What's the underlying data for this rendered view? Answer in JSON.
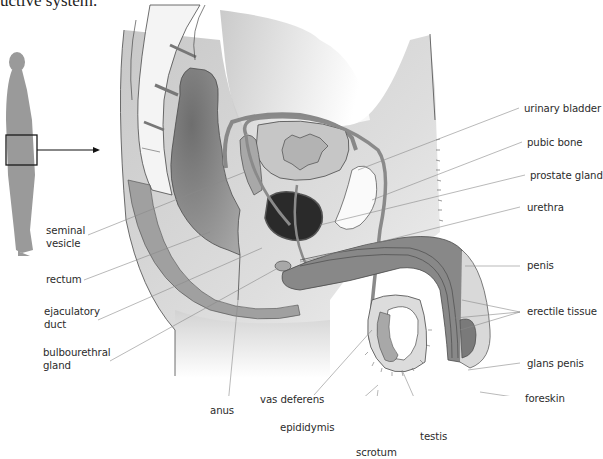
{
  "caption": "uctive system.",
  "figure": {
    "locator": {
      "description": "standing human silhouette with pelvic region boxed",
      "arrow": "arrow-right-icon"
    },
    "colors": {
      "tissue_light": "#e3e3e3",
      "tissue_mid": "#a9a9a9",
      "tissue_dark": "#7d7d7d",
      "prostate": "#2a2a2a",
      "bone": "#f4f4f4",
      "outline": "#4a4a4a",
      "leader": "#8a8a8a",
      "silhouette": "#9a9a9a"
    }
  },
  "labels": {
    "left": [
      {
        "id": "seminal-vesicle",
        "text": [
          "seminal",
          "vesicle"
        ]
      },
      {
        "id": "rectum",
        "text": [
          "rectum"
        ]
      },
      {
        "id": "ejaculatory-duct",
        "text": [
          "ejaculatory",
          "duct"
        ]
      },
      {
        "id": "bulbourethral-gland",
        "text": [
          "bulbourethral",
          "gland"
        ]
      }
    ],
    "right": [
      {
        "id": "urinary-bladder",
        "text": [
          "urinary bladder"
        ]
      },
      {
        "id": "pubic-bone",
        "text": [
          "pubic bone"
        ]
      },
      {
        "id": "prostate-gland",
        "text": [
          "prostate gland"
        ]
      },
      {
        "id": "urethra",
        "text": [
          "urethra"
        ]
      },
      {
        "id": "penis",
        "text": [
          "penis"
        ]
      },
      {
        "id": "erectile-tissue",
        "text": [
          "erectile tissue"
        ]
      },
      {
        "id": "glans-penis",
        "text": [
          "glans penis"
        ]
      },
      {
        "id": "foreskin",
        "text": [
          "foreskin"
        ]
      }
    ],
    "bottom": [
      {
        "id": "anus",
        "text": [
          "anus"
        ]
      },
      {
        "id": "vas-deferens",
        "text": [
          "vas deferens"
        ]
      },
      {
        "id": "epididymis",
        "text": [
          "epididymis"
        ]
      },
      {
        "id": "scrotum",
        "text": [
          "scrotum"
        ]
      },
      {
        "id": "testis",
        "text": [
          "testis"
        ]
      }
    ]
  }
}
